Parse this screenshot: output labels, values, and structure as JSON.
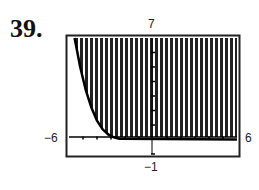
{
  "problem_number": "39.",
  "chart_data": {
    "type": "area",
    "title": "",
    "window": {
      "xmin": -6,
      "xmax": 6,
      "ymin": -1,
      "ymax": 7
    },
    "labels": {
      "ymax": "7",
      "xmin": "-6",
      "xmax": "6",
      "ymin": "-1"
    },
    "curve_points": [
      {
        "x": -5.6,
        "y": 7
      },
      {
        "x": -5.2,
        "y": 5
      },
      {
        "x": -4.8,
        "y": 3.4
      },
      {
        "x": -4.4,
        "y": 2.2
      },
      {
        "x": -4.0,
        "y": 1.3
      },
      {
        "x": -3.6,
        "y": 0.7
      },
      {
        "x": -3.2,
        "y": 0.35
      },
      {
        "x": -2.8,
        "y": 0.15
      },
      {
        "x": -2.4,
        "y": 0.05
      },
      {
        "x": 6,
        "y": 0
      }
    ],
    "shading": "above curve",
    "grid": false,
    "legend": null
  }
}
